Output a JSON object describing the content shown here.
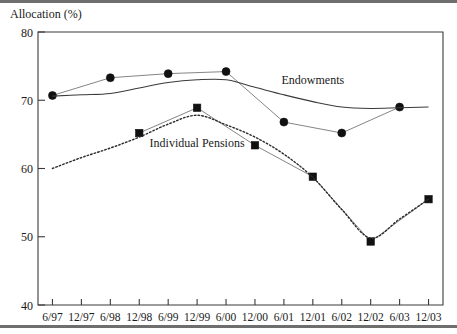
{
  "chart_data": {
    "type": "line",
    "title": "",
    "ylabel": "Allocation (%)",
    "xlabel": "",
    "ylim": [
      40,
      80
    ],
    "yticks": [
      40,
      50,
      60,
      70,
      80
    ],
    "ytick_labels": [
      "40",
      "50",
      "60",
      "70",
      "80"
    ],
    "grid": false,
    "legend_position": "inline-annotation",
    "categories": [
      "6/97",
      "12/97",
      "6/98",
      "12/98",
      "6/99",
      "12/99",
      "6/00",
      "12/00",
      "6/01",
      "12/01",
      "6/02",
      "12/02",
      "6/03",
      "12/03"
    ],
    "annotations": [
      {
        "text": "Endowments",
        "x_category": "12/01",
        "y_value": 72.4
      },
      {
        "text": "Individual Pensions",
        "x_category": "12/99",
        "y_value": 63.2
      }
    ],
    "series": [
      {
        "name": "Endowments",
        "marker": "circle",
        "line_style": "solid-thin",
        "x": [
          "6/97",
          "6/98",
          "6/99",
          "6/00",
          "6/01",
          "6/02",
          "6/03"
        ],
        "values": [
          70.7,
          73.3,
          73.9,
          74.2,
          66.8,
          65.2,
          69.0
        ]
      },
      {
        "name": "Endowments Trend",
        "marker": "none",
        "line_style": "solid-smooth",
        "x": [
          "6/97",
          "12/97",
          "6/98",
          "12/98",
          "6/99",
          "12/99",
          "6/00",
          "12/00",
          "6/01",
          "12/01",
          "6/02",
          "12/02",
          "6/03",
          "12/03"
        ],
        "values": [
          70.6,
          70.8,
          71.0,
          71.8,
          72.6,
          73.0,
          73.0,
          71.9,
          70.8,
          69.8,
          69.0,
          68.8,
          68.9,
          69.0
        ]
      },
      {
        "name": "Individual Pensions",
        "marker": "square",
        "line_style": "solid-thin",
        "x": [
          "12/98",
          "12/99",
          "12/00",
          "12/01",
          "12/02",
          "12/03"
        ],
        "values": [
          65.2,
          68.9,
          63.4,
          58.8,
          49.3,
          55.5
        ]
      },
      {
        "name": "Individual Pensions Trend",
        "marker": "none",
        "line_style": "dotted",
        "x": [
          "6/97",
          "12/97",
          "6/98",
          "12/98",
          "6/99",
          "12/99",
          "6/00",
          "12/00",
          "6/01",
          "12/01",
          "6/02",
          "12/02",
          "6/03",
          "12/03"
        ],
        "values": [
          60.0,
          61.6,
          63.0,
          64.6,
          66.5,
          67.8,
          66.4,
          64.6,
          62.1,
          58.7,
          54.0,
          49.8,
          52.6,
          55.5
        ]
      }
    ]
  }
}
